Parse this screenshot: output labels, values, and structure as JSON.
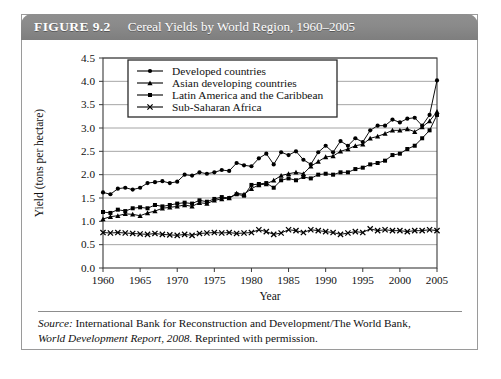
{
  "figure": {
    "label": "FIGURE 9.2",
    "title": "Cereal Yields by World Region, 1960–2005",
    "header_bg": "#8a8a8a",
    "header_text_color": "#ffffff"
  },
  "source": {
    "line1_prefix": "Source:",
    "line1_rest": " International Bank for Reconstruction and Development/The World Bank,",
    "line2_italic": "World Development Report, 2008.",
    "line2_rest": " Reprinted with permission."
  },
  "chart_data": {
    "type": "line",
    "title": "Cereal Yields by World Region, 1960–2005",
    "xlabel": "Year",
    "ylabel": "Yield (tons  per hectare)",
    "xlim": [
      1960,
      2005
    ],
    "ylim": [
      0.0,
      4.5
    ],
    "ytick_labels": [
      "0.0",
      "0.5",
      "1.0",
      "1.5",
      "2.0",
      "2.5",
      "3.0",
      "3.5",
      "4.0",
      "4.5"
    ],
    "yticks": [
      0.0,
      0.5,
      1.0,
      1.5,
      2.0,
      2.5,
      3.0,
      3.5,
      4.0,
      4.5
    ],
    "xtick_labels": [
      "1960",
      "1965",
      "1970",
      "1975",
      "1980",
      "1985",
      "1990",
      "1995",
      "2000",
      "2005"
    ],
    "xticks": [
      1960,
      1965,
      1970,
      1975,
      1980,
      1985,
      1990,
      1995,
      2000,
      2005
    ],
    "grid": "horizontal",
    "legend_position": "top-left-inside",
    "x": [
      1960,
      1961,
      1962,
      1963,
      1964,
      1965,
      1966,
      1967,
      1968,
      1969,
      1970,
      1971,
      1972,
      1973,
      1974,
      1975,
      1976,
      1977,
      1978,
      1979,
      1980,
      1981,
      1982,
      1983,
      1984,
      1985,
      1986,
      1987,
      1988,
      1989,
      1990,
      1991,
      1992,
      1993,
      1994,
      1995,
      1996,
      1997,
      1998,
      1999,
      2000,
      2001,
      2002,
      2003,
      2004,
      2005
    ],
    "series": [
      {
        "name": "Developed countries",
        "marker": "circle",
        "color": "#000000",
        "values": [
          1.62,
          1.58,
          1.7,
          1.72,
          1.68,
          1.72,
          1.82,
          1.84,
          1.86,
          1.82,
          1.85,
          2.0,
          1.98,
          2.05,
          2.02,
          2.05,
          2.1,
          2.08,
          2.25,
          2.2,
          2.18,
          2.35,
          2.45,
          2.22,
          2.48,
          2.42,
          2.5,
          2.32,
          2.22,
          2.48,
          2.62,
          2.48,
          2.72,
          2.62,
          2.78,
          2.7,
          2.95,
          3.05,
          3.05,
          3.18,
          3.12,
          3.2,
          3.22,
          3.05,
          3.28,
          4.02
        ]
      },
      {
        "name": "Asian developing countries",
        "marker": "triangle",
        "color": "#000000",
        "values": [
          1.05,
          1.1,
          1.12,
          1.16,
          1.15,
          1.12,
          1.18,
          1.22,
          1.28,
          1.3,
          1.32,
          1.35,
          1.32,
          1.4,
          1.38,
          1.45,
          1.48,
          1.5,
          1.6,
          1.58,
          1.7,
          1.78,
          1.8,
          1.88,
          1.98,
          2.02,
          2.05,
          2.02,
          2.18,
          2.28,
          2.38,
          2.4,
          2.5,
          2.55,
          2.62,
          2.65,
          2.78,
          2.82,
          2.88,
          2.95,
          2.95,
          2.98,
          2.92,
          3.02,
          3.15,
          3.35
        ]
      },
      {
        "name": "Latin America and the Caribbean",
        "marker": "square",
        "color": "#000000",
        "values": [
          1.2,
          1.18,
          1.25,
          1.22,
          1.28,
          1.3,
          1.28,
          1.35,
          1.32,
          1.35,
          1.38,
          1.4,
          1.38,
          1.45,
          1.42,
          1.48,
          1.52,
          1.5,
          1.58,
          1.55,
          1.78,
          1.8,
          1.82,
          1.72,
          1.88,
          1.92,
          1.88,
          1.95,
          1.92,
          2.0,
          2.02,
          2.0,
          2.05,
          2.05,
          2.12,
          2.15,
          2.22,
          2.25,
          2.3,
          2.42,
          2.45,
          2.55,
          2.62,
          2.78,
          2.95,
          3.28
        ]
      },
      {
        "name": "Sub-Saharan Africa",
        "marker": "x",
        "color": "#000000",
        "values": [
          0.76,
          0.75,
          0.76,
          0.75,
          0.74,
          0.73,
          0.72,
          0.74,
          0.72,
          0.71,
          0.7,
          0.72,
          0.7,
          0.74,
          0.75,
          0.76,
          0.75,
          0.76,
          0.74,
          0.75,
          0.76,
          0.82,
          0.78,
          0.72,
          0.75,
          0.82,
          0.8,
          0.76,
          0.82,
          0.8,
          0.78,
          0.76,
          0.72,
          0.75,
          0.78,
          0.76,
          0.84,
          0.8,
          0.82,
          0.8,
          0.8,
          0.78,
          0.8,
          0.8,
          0.82,
          0.8
        ]
      }
    ]
  }
}
